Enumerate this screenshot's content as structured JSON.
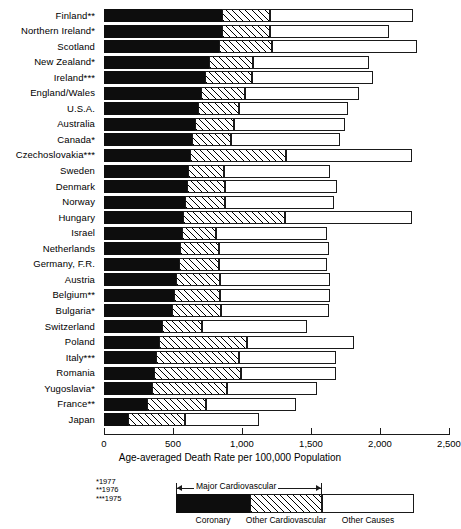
{
  "chart_data": {
    "type": "bar",
    "orientation": "horizontal",
    "stacked": true,
    "title": "",
    "xlabel": "Age-averaged Death Rate per 100,000 Population",
    "ylabel": "",
    "xlim": [
      0,
      2500
    ],
    "xticks": [
      0,
      500,
      1000,
      1500,
      2000,
      2500
    ],
    "xticklabels": [
      "0",
      "500",
      "1,000",
      "1,500",
      "2,000",
      "2,500"
    ],
    "grid": false,
    "legend_position": "bottom",
    "categories": [
      "Finland**",
      "Northern Ireland*",
      "Scotland",
      "New Zealand*",
      "Ireland***",
      "England/Wales",
      "U.S.A.",
      "Australia",
      "Canada*",
      "Czechoslovakia***",
      "Sweden",
      "Denmark",
      "Norway",
      "Hungary",
      "Israel",
      "Netherlands",
      "Germany, F.R.",
      "Austria",
      "Belgium**",
      "Bulgaria*",
      "Switzerland",
      "Poland",
      "Italy***",
      "Romania",
      "Yugoslavia*",
      "France**",
      "Japan"
    ],
    "series": [
      {
        "name": "Coronary",
        "values": [
          855,
          855,
          835,
          760,
          735,
          705,
          680,
          660,
          640,
          620,
          610,
          600,
          590,
          575,
          565,
          550,
          540,
          525,
          510,
          495,
          420,
          395,
          380,
          360,
          345,
          310,
          175
        ]
      },
      {
        "name": "Other Cardiovascular",
        "values": [
          345,
          345,
          380,
          320,
          335,
          320,
          295,
          285,
          280,
          700,
          260,
          280,
          290,
          740,
          250,
          280,
          290,
          315,
          330,
          350,
          290,
          640,
          600,
          630,
          545,
          430,
          410
        ]
      },
      {
        "name": "Other Causes",
        "values": [
          1040,
          865,
          1050,
          840,
          880,
          820,
          795,
          800,
          790,
          910,
          770,
          810,
          785,
          915,
          800,
          800,
          785,
          800,
          800,
          785,
          760,
          780,
          700,
          690,
          650,
          650,
          535
        ]
      }
    ],
    "totals": [
      2240,
      2065,
      2265,
      1920,
      1950,
      1845,
      1770,
      1745,
      1710,
      2230,
      1640,
      1690,
      1665,
      2230,
      1615,
      1630,
      1615,
      1640,
      1640,
      1630,
      1470,
      1815,
      1680,
      1680,
      1540,
      1390,
      1120
    ],
    "legend": [
      {
        "label": "Coronary",
        "pattern": "solid-black",
        "color": "#0d0d0d"
      },
      {
        "label": "Other Cardiovascular",
        "pattern": "diagonal-hatch",
        "color": "#ffffff"
      },
      {
        "label": "Other Causes",
        "pattern": "solid-white",
        "color": "#ffffff"
      }
    ],
    "legend_bracket_label": "Major Cardiovascular",
    "annotations": [
      "*1977",
      "**1976",
      "***1975"
    ]
  },
  "footnotes": {
    "one": "*1977",
    "two": "**1976",
    "three": "***1975"
  }
}
